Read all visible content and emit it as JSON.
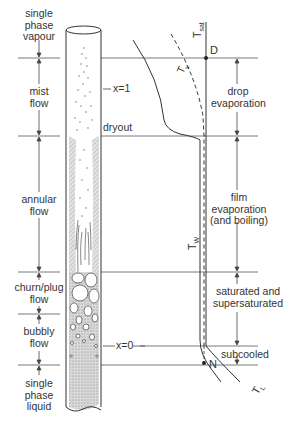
{
  "diagram": {
    "type": "two-phase flow regimes and temperature profiles in a vertical heated tube",
    "flow_regimes": [
      {
        "id": "single-phase-vapour",
        "lines": [
          "single",
          "phase",
          "vapour"
        ]
      },
      {
        "id": "mist-flow",
        "lines": [
          "mist",
          "flow"
        ]
      },
      {
        "id": "annular-flow",
        "lines": [
          "annular",
          "flow"
        ]
      },
      {
        "id": "churn-plug-flow",
        "lines": [
          "churn/plug",
          "flow"
        ]
      },
      {
        "id": "bubbly-flow",
        "lines": [
          "bubbly",
          "flow"
        ]
      },
      {
        "id": "single-phase-liquid",
        "lines": [
          "single",
          "phase",
          "liquid"
        ]
      }
    ],
    "tube_markers": {
      "x1": "x=1",
      "dryout": "dryout",
      "x0": "x=0"
    },
    "heat_transfer_regions": [
      {
        "id": "drop-evaporation",
        "lines": [
          "drop",
          "evaporation"
        ]
      },
      {
        "id": "film-evaporation",
        "lines": [
          "film",
          "evaporation",
          "(and boiling)"
        ]
      },
      {
        "id": "saturated",
        "lines": [
          "saturated and",
          "supersaturated"
        ]
      },
      {
        "id": "subcooled",
        "lines": [
          "subcooled"
        ]
      }
    ],
    "temperature_labels": {
      "t_sat": "T",
      "t_sat_sub": "sat",
      "t_v": "T",
      "t_v_sub": "v",
      "t_w": "T",
      "t_w_sub": "W",
      "t_l": "T",
      "t_l_sub": "L"
    },
    "points": {
      "D": "D",
      "N": "N"
    }
  }
}
